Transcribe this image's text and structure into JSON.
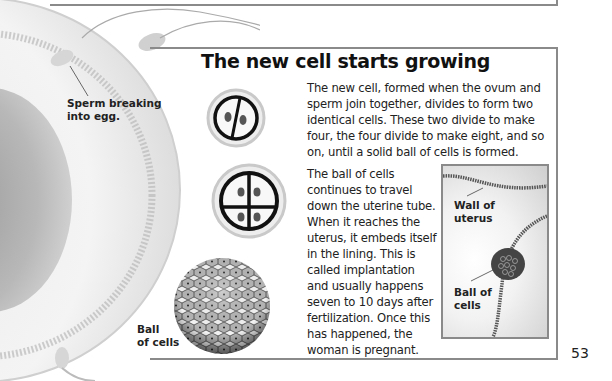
{
  "page": {
    "title": "The new cell starts growing",
    "paragraphs": [
      "The new cell, formed when the ovum and sperm join together, divides to form two identical cells. These two divide to make four, the four divide to make eight, and so on, until a solid ball of cells is formed.",
      "The ball of cells continues to travel down the uterine tube. When it reaches the uterus, it embeds itself in the lining. This is called implantation and usually happens seven to 10 days after fertilization. Once this has happened, the woman is pregnant."
    ],
    "page_number": "53"
  },
  "illustrations": {
    "egg_label": [
      "Sperm breaking",
      "into egg."
    ],
    "two_cell": "two-cell-stage",
    "four_cell": "four-cell-stage",
    "ball_label": [
      "Ball",
      "of cells"
    ],
    "inset": {
      "wall_label": [
        "Wall of",
        "uterus"
      ],
      "ball_label": [
        "Ball of",
        "cells"
      ]
    }
  },
  "colors": {
    "frame": "#8a8a8a",
    "text": "#1a1a1a"
  }
}
